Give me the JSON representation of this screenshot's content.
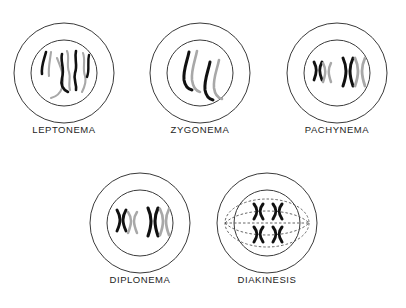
{
  "figure": {
    "background_color": "#ffffff",
    "outline_color": "#3a3a3a",
    "chromosome_dark_color": "#111111",
    "chromosome_light_color": "#a8a8a8",
    "spindle_color": "#555555",
    "label_color": "#1d1d1d",
    "width": 406,
    "height": 308
  },
  "stages": [
    {
      "id": "leptonema",
      "label": "LEPTONEMA",
      "row": 1,
      "column": 1,
      "center_x": 64,
      "center_y": 73,
      "outer_radius": 50,
      "nucleus_radius": 33,
      "chromosome_form": "long-thin-unpaired-threads",
      "chromosome_count": 4,
      "has_spindle": false,
      "description": "Long thin single threads, paired sister strands not yet visible"
    },
    {
      "id": "zygonema",
      "label": "ZYGONEMA",
      "row": 1,
      "column": 2,
      "center_x": 200,
      "center_y": 73,
      "outer_radius": 50,
      "nucleus_radius": 33,
      "chromosome_form": "synapsing-paired-threads",
      "chromosome_count": 2,
      "has_spindle": false,
      "description": "Homologous threads align side by side in synapsis"
    },
    {
      "id": "pachynema",
      "label": "PACHYNEMA",
      "row": 1,
      "column": 3,
      "center_x": 337,
      "center_y": 73,
      "outer_radius": 50,
      "nucleus_radius": 33,
      "chromosome_form": "thickened-bivalent-x",
      "chromosome_count": 2,
      "has_spindle": false,
      "description": "Shortened thickened bivalents, tightly paired homologues"
    },
    {
      "id": "diplonema",
      "label": "DIPLONEMA",
      "row": 2,
      "column": 1,
      "center_x": 140,
      "center_y": 223,
      "outer_radius": 50,
      "nucleus_radius": 33,
      "chromosome_form": "separating-bivalent-x",
      "chromosome_count": 2,
      "has_spindle": false,
      "description": "Homologues begin to separate, chiasmata remain"
    },
    {
      "id": "diakinesis",
      "label": "DIAKINESIS",
      "row": 2,
      "column": 2,
      "center_x": 267,
      "center_y": 223,
      "outer_radius": 50,
      "nucleus_radius": 33,
      "chromosome_form": "condensed-x-tetrad",
      "chromosome_count": 4,
      "has_spindle": true,
      "description": "Maximally condensed chromosomes, nuclear envelope breaking, spindle forming"
    }
  ]
}
